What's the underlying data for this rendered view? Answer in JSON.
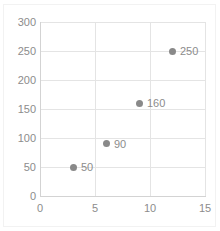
{
  "chart_data": {
    "type": "scatter",
    "title": "",
    "xlabel": "",
    "ylabel": "",
    "xlim": [
      0,
      15
    ],
    "ylim": [
      0,
      300
    ],
    "xticks": [
      0,
      5,
      10,
      15
    ],
    "yticks": [
      0,
      50,
      100,
      150,
      200,
      250,
      300
    ],
    "xtick_labels": [
      "0",
      "5",
      "10",
      "15"
    ],
    "ytick_labels": [
      "0",
      "50",
      "100",
      "150",
      "200",
      "250",
      "300"
    ],
    "grid": true,
    "legend": false,
    "marker_color": "#898989",
    "gridline_color": "#e4e4e4",
    "axis_color": "#d3d3d3",
    "text_color": "#8c8c8c",
    "series": [
      {
        "name": "Series 1",
        "points": [
          {
            "x": 3,
            "y": 50,
            "label": "50"
          },
          {
            "x": 6,
            "y": 90,
            "label": "90"
          },
          {
            "x": 9,
            "y": 160,
            "label": "160"
          },
          {
            "x": 12,
            "y": 250,
            "label": "250"
          }
        ]
      }
    ],
    "data_labels_shown": true
  }
}
